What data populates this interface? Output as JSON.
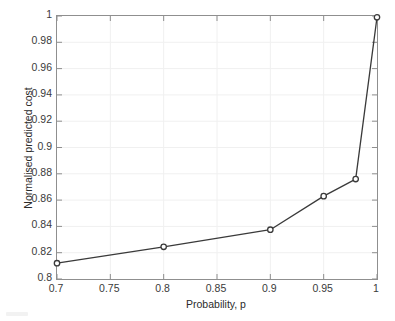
{
  "chart_data": {
    "type": "line",
    "title": "",
    "subtitle": "",
    "xlabel": "Probability, p",
    "ylabel": "Normalised predicted cost",
    "xlim": [
      0.7,
      1.0
    ],
    "ylim": [
      0.8,
      1.0
    ],
    "grid": true,
    "legend": null,
    "legend_position": "none",
    "marker": "circle-open",
    "line_color": "#3a3a3a",
    "marker_color": "#3a3a3a",
    "grid_color": "#f0f0f0",
    "axis_color": "#8f8f8f",
    "background_color": "#ffffff",
    "x": [
      0.7,
      0.8,
      0.9,
      0.95,
      0.98,
      1.0
    ],
    "values": [
      0.812,
      0.8245,
      0.8375,
      0.863,
      0.876,
      0.999
    ],
    "series": [
      {
        "name": "Normalised predicted cost",
        "x": [
          0.7,
          0.8,
          0.9,
          0.95,
          0.98,
          1.0
        ],
        "values": [
          0.812,
          0.8245,
          0.8375,
          0.863,
          0.876,
          0.999
        ]
      }
    ],
    "xticks": [
      0.7,
      0.75,
      0.8,
      0.85,
      0.9,
      0.95,
      1.0
    ],
    "xtick_labels": [
      "0.7",
      "0.75",
      "0.8",
      "0.85",
      "0.9",
      "0.95",
      "1"
    ],
    "yticks": [
      0.8,
      0.82,
      0.84,
      0.86,
      0.88,
      0.9,
      0.92,
      0.94,
      0.96,
      0.98,
      1.0
    ],
    "ytick_labels": [
      "0.8",
      "0.82",
      "0.84",
      "0.86",
      "0.88",
      "0.9",
      "0.92",
      "0.94",
      "0.96",
      "0.98",
      "1"
    ],
    "annotations": []
  }
}
